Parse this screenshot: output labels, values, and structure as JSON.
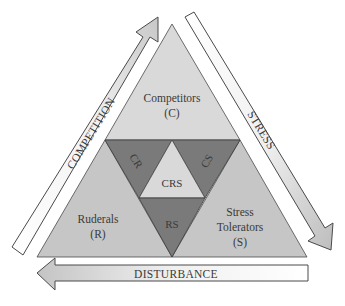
{
  "diagram": {
    "regions": {
      "competitors": {
        "label": "Competitors",
        "abbr": "(C)"
      },
      "ruderals": {
        "label": "Ruderals",
        "abbr": "(R)"
      },
      "stress_tolerators": {
        "label_line1": "Stress",
        "label_line2": "Tolerators",
        "abbr": "(S)"
      },
      "cr": {
        "label": "CR"
      },
      "cs": {
        "label": "CS"
      },
      "rs": {
        "label": "RS"
      },
      "crs": {
        "label": "CRS"
      }
    },
    "arrows": {
      "competition": {
        "label": "COMPETITION",
        "direction": "up-right"
      },
      "stress": {
        "label": "STRESS",
        "direction": "down-right"
      },
      "disturbance": {
        "label": "DISTURBANCE",
        "direction": "left"
      }
    },
    "colors": {
      "outer_light": "#d9d9d9",
      "outer_mid": "#c6c6c6",
      "mixed_dark": "#7a7a7a",
      "stroke": "#4a4a4a",
      "text": "#3a3a3a"
    }
  }
}
